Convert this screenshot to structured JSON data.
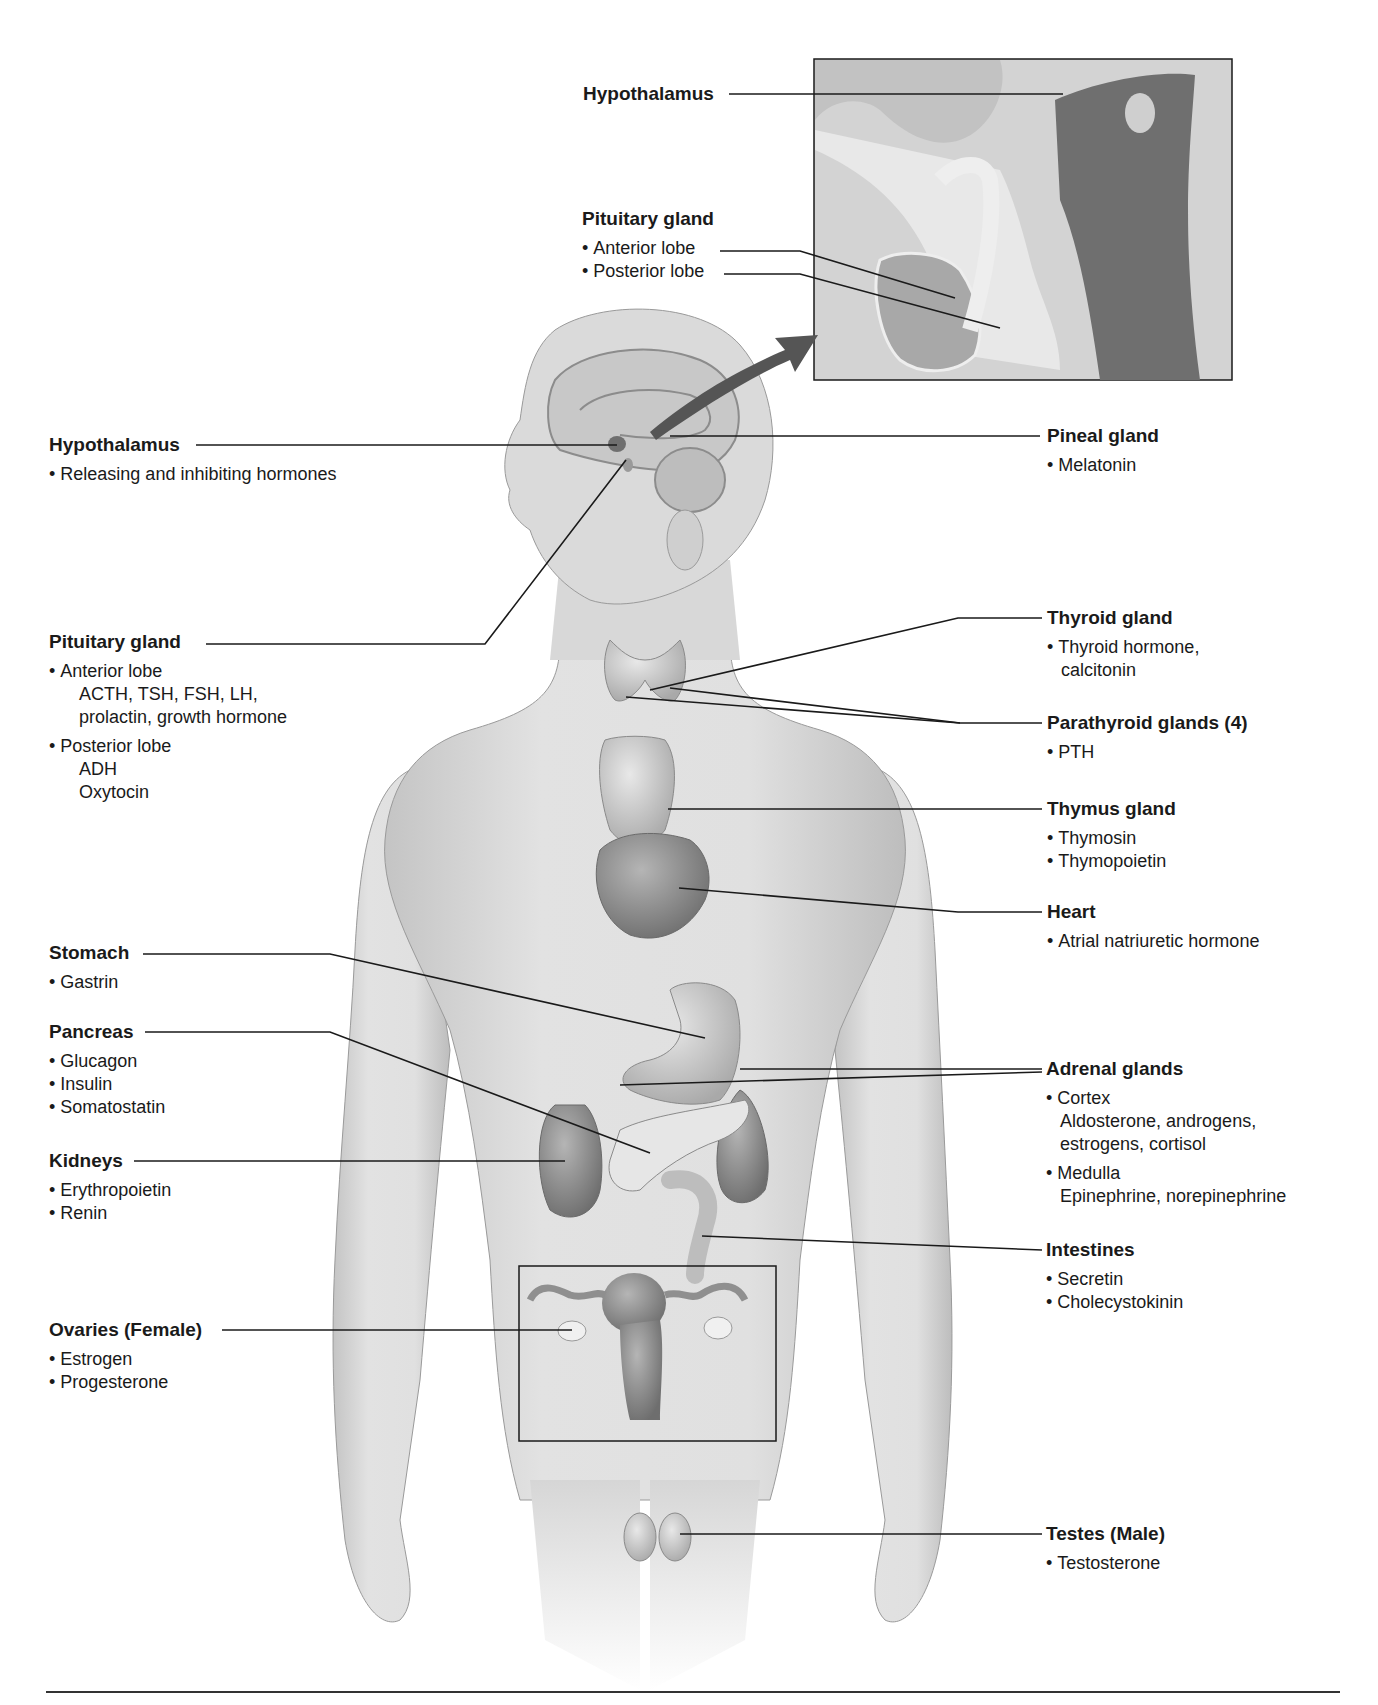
{
  "inset": {
    "hypothalamus_title": "Hypothalamus",
    "pituitary_title": "Pituitary gland",
    "pituitary_items": [
      "Anterior lobe",
      "Posterior lobe"
    ]
  },
  "left_labels": {
    "hypothalamus": {
      "title": "Hypothalamus",
      "items": [
        "Releasing and inhibiting hormones"
      ]
    },
    "pituitary": {
      "title": "Pituitary gland",
      "anterior": {
        "label": "Anterior lobe",
        "lines": [
          "ACTH, TSH, FSH, LH,",
          "prolactin, growth hormone"
        ]
      },
      "posterior": {
        "label": "Posterior lobe",
        "lines": [
          "ADH",
          "Oxytocin"
        ]
      }
    },
    "stomach": {
      "title": "Stomach",
      "items": [
        "Gastrin"
      ]
    },
    "pancreas": {
      "title": "Pancreas",
      "items": [
        "Glucagon",
        "Insulin",
        "Somatostatin"
      ]
    },
    "kidneys": {
      "title": "Kidneys",
      "items": [
        "Erythropoietin",
        "Renin"
      ]
    },
    "ovaries": {
      "title": "Ovaries (Female)",
      "items": [
        "Estrogen",
        "Progesterone"
      ]
    }
  },
  "right_labels": {
    "pineal": {
      "title": "Pineal gland",
      "items": [
        "Melatonin"
      ]
    },
    "thyroid": {
      "title": "Thyroid gland",
      "lines": [
        "Thyroid hormone,",
        "calcitonin"
      ]
    },
    "parathyroid": {
      "title": "Parathyroid glands (4)",
      "items": [
        "PTH"
      ]
    },
    "thymus": {
      "title": "Thymus gland",
      "items": [
        "Thymosin",
        "Thymopoietin"
      ]
    },
    "heart": {
      "title": "Heart",
      "items": [
        "Atrial natriuretic hormone"
      ]
    },
    "adrenal": {
      "title": "Adrenal glands",
      "cortex": {
        "label": "Cortex",
        "lines": [
          "Aldosterone, androgens,",
          "estrogens, cortisol"
        ]
      },
      "medulla": {
        "label": "Medulla",
        "lines": [
          "Epinephrine, norepinephrine"
        ]
      }
    },
    "intestines": {
      "title": "Intestines",
      "items": [
        "Secretin",
        "Cholecystokinin"
      ]
    },
    "testes": {
      "title": "Testes (Male)",
      "items": [
        "Testosterone"
      ]
    }
  },
  "colors": {
    "skin": "#d9d9d9",
    "organ_dark": "#7a7a7a",
    "organ_mid": "#a8a8a8",
    "line": "#1a1a1a"
  }
}
